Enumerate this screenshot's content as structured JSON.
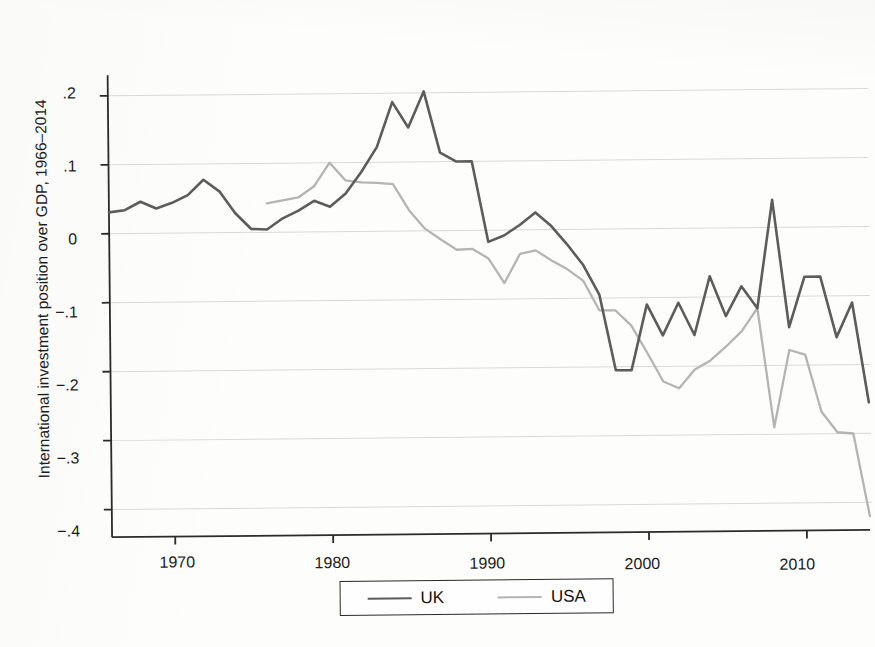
{
  "figure": {
    "title": "",
    "caption_partial": ""
  },
  "legend": {
    "position": "below-axis",
    "entries": [
      {
        "label": "UK",
        "color": "#5c5c5c",
        "swatch": "line-swatch-uk"
      },
      {
        "label": "USA",
        "color": "#b4b4b4",
        "swatch": "line-swatch-usa"
      }
    ]
  },
  "axes": {
    "ylabel": "International investment position over GDP, 1966–2014",
    "xlabel": "",
    "yticks": [
      ".2",
      ".1",
      "0",
      "−.1",
      "−.2",
      "−.3",
      "−.4"
    ],
    "xticks": [
      "1970",
      "1980",
      "1990",
      "2000",
      "2010"
    ]
  },
  "chart_data": {
    "type": "line",
    "title": "International investment position over GDP, 1966–2014",
    "xlabel": "",
    "ylabel": "International investment position over GDP, 1966–2014",
    "xlim": [
      1966,
      2014
    ],
    "ylim": [
      -0.44,
      0.23
    ],
    "yticks": [
      0.2,
      0.1,
      0,
      -0.1,
      -0.2,
      -0.3,
      -0.4
    ],
    "ytick_labels": [
      ".2",
      ".1",
      "0",
      "−.1",
      "−.2",
      "−.3",
      "−.4"
    ],
    "xticks": [
      1970,
      1980,
      1990,
      2000,
      2010
    ],
    "xtick_labels": [
      "1970",
      "1980",
      "1990",
      "2000",
      "2010"
    ],
    "grid": "horizontal",
    "legend_position": "bottom",
    "series": [
      {
        "name": "UK",
        "color": "#5c5c5c",
        "x": [
          1966,
          1967,
          1968,
          1969,
          1970,
          1971,
          1972,
          1973,
          1974,
          1975,
          1976,
          1977,
          1978,
          1979,
          1980,
          1981,
          1982,
          1983,
          1984,
          1985,
          1986,
          1987,
          1988,
          1989,
          1990,
          1991,
          1992,
          1993,
          1994,
          1995,
          1996,
          1997,
          1998,
          1999,
          2000,
          2001,
          2002,
          2003,
          2004,
          2005,
          2006,
          2007,
          2008,
          2009,
          2010,
          2011,
          2012,
          2013,
          2014
        ],
        "y": [
          0.031,
          0.034,
          0.046,
          0.036,
          0.044,
          0.055,
          0.077,
          0.06,
          0.028,
          0.005,
          0.004,
          0.02,
          0.031,
          0.045,
          0.036,
          0.055,
          0.086,
          0.122,
          0.187,
          0.15,
          0.202,
          0.113,
          0.1,
          0.1,
          -0.017,
          -0.008,
          0.007,
          0.025,
          0.005,
          -0.022,
          -0.052,
          -0.095,
          -0.205,
          -0.205,
          -0.11,
          -0.155,
          -0.108,
          -0.155,
          -0.07,
          -0.128,
          -0.085,
          -0.117,
          0.04,
          -0.145,
          -0.072,
          -0.072,
          -0.16,
          -0.11,
          -0.255
        ]
      },
      {
        "name": "USA",
        "color": "#b4b4b4",
        "x": [
          1976,
          1977,
          1978,
          1979,
          1980,
          1981,
          1982,
          1983,
          1984,
          1985,
          1986,
          1987,
          1988,
          1989,
          1990,
          1991,
          1992,
          1993,
          1994,
          1995,
          1996,
          1997,
          1998,
          1999,
          2000,
          2001,
          2002,
          2003,
          2004,
          2005,
          2006,
          2007,
          2008,
          2009,
          2010,
          2011,
          2012,
          2013,
          2014
        ],
        "y": [
          0.042,
          0.046,
          0.05,
          0.066,
          0.1,
          0.074,
          0.071,
          0.07,
          0.068,
          0.03,
          0.003,
          -0.013,
          -0.028,
          -0.027,
          -0.041,
          -0.077,
          -0.035,
          -0.03,
          -0.045,
          -0.058,
          -0.075,
          -0.118,
          -0.118,
          -0.14,
          -0.18,
          -0.222,
          -0.232,
          -0.205,
          -0.192,
          -0.172,
          -0.15,
          -0.117,
          -0.29,
          -0.178,
          -0.185,
          -0.268,
          -0.298,
          -0.3,
          -0.42
        ]
      }
    ]
  }
}
